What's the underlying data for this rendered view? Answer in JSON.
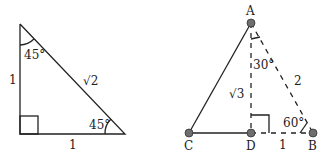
{
  "left_triangle": {
    "type": "45-45-90 right triangle",
    "angles": {
      "top": "45°",
      "bottom_right": "45°"
    },
    "sides": {
      "vertical": "1",
      "horizontal": "1",
      "hypotenuse": "√2"
    }
  },
  "right_triangle": {
    "type": "30-60-90 triangle (half of equilateral)",
    "points": {
      "A": "A",
      "B": "B",
      "C": "C",
      "D": "D"
    },
    "angles": {
      "at_A": "30°",
      "at_B": "60°"
    },
    "sides": {
      "AD": "√3",
      "AB": "2",
      "DB": "1"
    }
  }
}
